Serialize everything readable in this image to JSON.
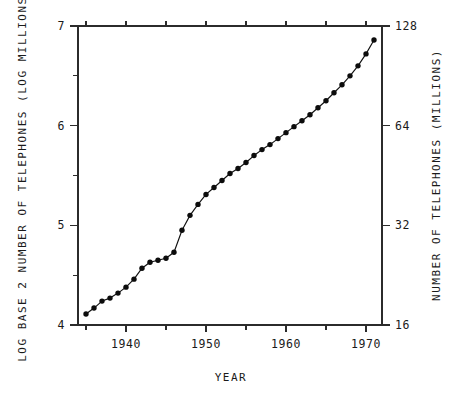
{
  "chart_data": {
    "type": "line",
    "title": "",
    "subtitle": "",
    "xlabel": "YEAR",
    "ylabel": "LOG BASE 2 NUMBER OF TELEPHONES (LOG MILLIONS)",
    "y2label": "NUMBER OF TELEPHONES (MILLIONS)",
    "xlim": [
      1934,
      1972
    ],
    "ylim": [
      4,
      7
    ],
    "y2lim": [
      16,
      128
    ],
    "grid": false,
    "legend": null,
    "marker": "filled-circle",
    "x_major_ticks": [
      1940,
      1950,
      1960,
      1970
    ],
    "x_major_tick_labels": [
      "1940",
      "1950",
      "1960",
      "1970"
    ],
    "x_minor_ticks": [
      1935,
      1945,
      1955,
      1965
    ],
    "y_major_ticks": [
      4,
      5,
      6,
      7
    ],
    "y_major_tick_labels": [
      "4",
      "5",
      "6",
      "7"
    ],
    "y_minor_ticks": [
      4.5,
      5.5,
      6.5
    ],
    "y2_major_ticks": [
      16,
      32,
      64,
      128
    ],
    "y2_major_tick_labels": [
      "16",
      "32",
      "64",
      "128"
    ],
    "x": [
      1935,
      1936,
      1937,
      1938,
      1939,
      1940,
      1941,
      1942,
      1943,
      1944,
      1945,
      1946,
      1947,
      1948,
      1949,
      1950,
      1951,
      1952,
      1953,
      1954,
      1955,
      1956,
      1957,
      1958,
      1959,
      1960,
      1961,
      1962,
      1963,
      1964,
      1965,
      1966,
      1967,
      1968,
      1969,
      1970,
      1971
    ],
    "values": [
      4.11,
      4.17,
      4.24,
      4.27,
      4.32,
      4.38,
      4.46,
      4.57,
      4.63,
      4.65,
      4.67,
      4.73,
      4.95,
      5.1,
      5.21,
      5.31,
      5.38,
      5.45,
      5.52,
      5.57,
      5.63,
      5.7,
      5.76,
      5.81,
      5.87,
      5.93,
      5.99,
      6.05,
      6.11,
      6.18,
      6.25,
      6.33,
      6.41,
      6.5,
      6.6,
      6.72,
      6.86
    ],
    "series": [
      {
        "name": "Number of telephones (log base 2, millions)",
        "values": [
          4.11,
          4.17,
          4.24,
          4.27,
          4.32,
          4.38,
          4.46,
          4.57,
          4.63,
          4.65,
          4.67,
          4.73,
          4.95,
          5.1,
          5.21,
          5.31,
          5.38,
          5.45,
          5.52,
          5.57,
          5.63,
          5.7,
          5.76,
          5.81,
          5.87,
          5.93,
          5.99,
          6.05,
          6.11,
          6.18,
          6.25,
          6.33,
          6.41,
          6.5,
          6.6,
          6.72,
          6.86
        ]
      }
    ]
  }
}
